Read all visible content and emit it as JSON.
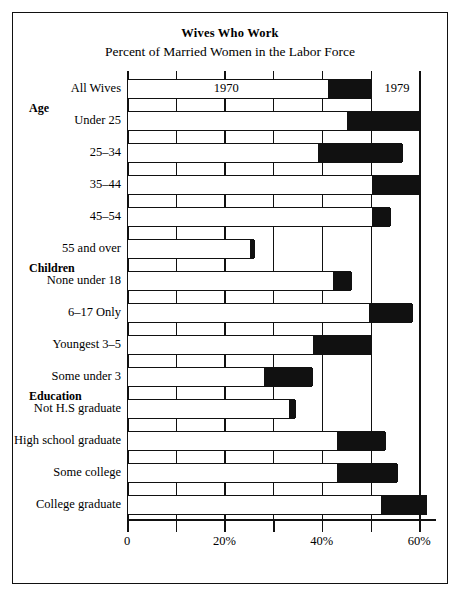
{
  "chart": {
    "title": "Wives Who Work",
    "subtitle": "Percent of Married Women in the Labor Force",
    "series_label_1970": "1970",
    "series_label_1979": "1979",
    "axis_ticks": [
      "0",
      "",
      "20%",
      "",
      "40%",
      "",
      "60%"
    ],
    "tick_values": [
      0,
      10,
      20,
      30,
      40,
      50,
      60
    ]
  },
  "groups": [
    {
      "name": "Age"
    },
    {
      "name": "Children"
    },
    {
      "name": "Education"
    }
  ],
  "rows": [
    {
      "label": "All Wives",
      "v1970": 41.0,
      "v1979": 50.0
    },
    {
      "label": "Under 25",
      "v1970": 45.0,
      "v1979": 60.0
    },
    {
      "label": "25–34",
      "v1970": 39.0,
      "v1979": 56.5
    },
    {
      "label": "35–44",
      "v1970": 50.0,
      "v1979": 60.0
    },
    {
      "label": "45–54",
      "v1970": 50.0,
      "v1979": 54.0
    },
    {
      "label": "55 and over",
      "v1970": 25.0,
      "v1979": 26.0
    },
    {
      "label": "None under 18",
      "v1970": 42.0,
      "v1979": 46.0
    },
    {
      "label": "6–17 Only",
      "v1970": 49.5,
      "v1979": 58.5
    },
    {
      "label": "Youngest 3–5",
      "v1970": 38.0,
      "v1979": 50.0
    },
    {
      "label": "Some under 3",
      "v1970": 28.0,
      "v1979": 38.0
    },
    {
      "label": "Not H.S graduate",
      "v1970": 33.0,
      "v1979": 34.5
    },
    {
      "label": "High school graduate",
      "v1970": 43.0,
      "v1979": 53.0
    },
    {
      "label": "Some college",
      "v1970": 43.0,
      "v1979": 55.5
    },
    {
      "label": "College graduate",
      "v1970": 52.0,
      "v1979": 61.5
    }
  ],
  "chart_data": {
    "type": "bar",
    "title": "Wives Who Work",
    "subtitle": "Percent of Married Women in the Labor Force",
    "orientation": "horizontal",
    "xlabel": "",
    "ylabel": "",
    "xlim": [
      0,
      63
    ],
    "grid": true,
    "legend": {
      "position": "inline-first-bar",
      "entries": [
        "1970",
        "1979"
      ]
    },
    "categories": [
      "All Wives",
      "Under 25",
      "25–34",
      "35–44",
      "45–54",
      "55 and over",
      "None under 18",
      "6–17 Only",
      "Youngest 3–5",
      "Some under 3",
      "Not H.S graduate",
      "High school graduate",
      "Some college",
      "College graduate"
    ],
    "group_headers": {
      "Age": 0,
      "Children": 6,
      "Education": 10
    },
    "series": [
      {
        "name": "1970",
        "values": [
          41.0,
          45.0,
          39.0,
          50.0,
          50.0,
          25.0,
          42.0,
          49.5,
          38.0,
          28.0,
          33.0,
          43.0,
          43.0,
          52.0
        ]
      },
      {
        "name": "1979",
        "values": [
          50.0,
          60.0,
          56.5,
          60.0,
          54.0,
          26.0,
          46.0,
          58.5,
          50.0,
          38.0,
          34.5,
          53.0,
          55.5,
          61.5
        ]
      }
    ],
    "xticks": [
      0,
      10,
      20,
      30,
      40,
      50,
      60
    ],
    "xticklabels": [
      "0",
      "",
      "20%",
      "",
      "40%",
      "",
      "60%"
    ]
  }
}
